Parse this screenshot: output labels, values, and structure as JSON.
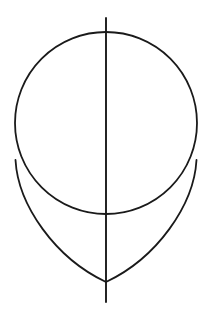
{
  "document": {
    "title": "Egg construction line drawing",
    "background_color": "#ffffff",
    "width": 211,
    "height": 319
  },
  "drawing": {
    "style": {
      "stroke_color": "#1a1a1a",
      "stroke_width": 1.8,
      "fill": "none"
    },
    "shapes": [
      {
        "id": "construction-circle",
        "name": "circle",
        "type": "circle",
        "cx": 106,
        "cy": 123,
        "r": 91,
        "label": "Construction circle"
      },
      {
        "id": "egg-left-curve",
        "name": "left-taper-curve",
        "type": "path",
        "d": "M 15.5 160 C 18 205 55 258 106 282",
        "label": "Left tapering curve"
      },
      {
        "id": "egg-right-curve",
        "name": "right-taper-curve",
        "type": "path",
        "d": "M 196.5 160 C 194 205 157 258 106 282",
        "label": "Right tapering curve"
      },
      {
        "id": "center-axis-line",
        "name": "vertical-axis",
        "type": "line",
        "x1": 106,
        "y1": 18,
        "x2": 106,
        "y2": 302,
        "label": "Vertical center axis"
      }
    ],
    "key_points": {
      "circle_top": [
        106,
        32
      ],
      "circle_bottom": [
        106,
        214
      ],
      "circle_left": [
        15,
        123
      ],
      "circle_right": [
        197,
        123
      ],
      "left_tangent": [
        15.5,
        160
      ],
      "right_tangent": [
        196.5,
        160
      ],
      "apex_bottom": [
        106,
        282
      ],
      "axis_top": [
        106,
        18
      ],
      "axis_bottom": [
        106,
        302
      ]
    }
  }
}
